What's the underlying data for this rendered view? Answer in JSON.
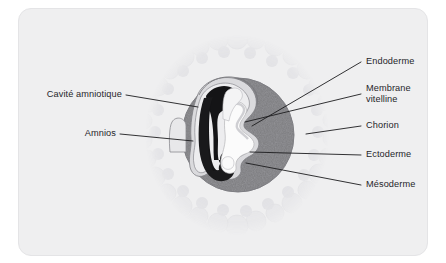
{
  "figure": {
    "width": 446,
    "height": 263,
    "background_color": "#ffffff",
    "panel_color": "#efeff0",
    "panel_border_color": "#e4e4e6"
  },
  "diagram": {
    "type": "labelled anatomical cross-section",
    "structures": [
      {
        "name": "villosites-choriales",
        "description": "halo fuzzy de villosites autour de l'oeuf",
        "color": "#e2e2e4"
      },
      {
        "name": "chorion-disc",
        "description": "disque gris entourant l'embryon",
        "color": "#9e9ea2"
      },
      {
        "name": "cavite-amniotique",
        "description": "zone noire en forme de C a gauche de l'embryon",
        "color": "#141416"
      },
      {
        "name": "amnios",
        "description": "fine membrane claire bordant la cavite amniotique",
        "color": "#d8d8da"
      },
      {
        "name": "vesicule-vitelline",
        "description": "region blanche centrale lobee",
        "color": "#fbfbfb"
      },
      {
        "name": "membrane-vitelline",
        "description": "liseré clair autour de la vesicule vitelline",
        "color": "#e7e7e9"
      },
      {
        "name": "pocket-left",
        "description": "petite poche claire a gauche dans le chorion",
        "color": "#e9e9ea"
      }
    ]
  },
  "labels": {
    "left": [
      {
        "id": "cavite-amniotique",
        "text": "Cavité amniotique",
        "text_x": 118,
        "text_y": 95,
        "anchor_x": 122,
        "anchor_y": 95,
        "tip_x": 196,
        "tip_y": 107
      },
      {
        "id": "amnios",
        "text": "Amnios",
        "text_x": 112,
        "text_y": 134,
        "anchor_x": 116,
        "anchor_y": 134,
        "tip_x": 192,
        "tip_y": 141
      }
    ],
    "right": [
      {
        "id": "endoderme",
        "text": "Endoderme",
        "text_x": 366,
        "text_y": 62,
        "anchor_x": 362,
        "anchor_y": 62,
        "tip_x": 253,
        "tip_y": 125
      },
      {
        "id": "membrane-vitelline",
        "text": "Membrane\nvitelline",
        "line1": "Membrane",
        "line2": "vitelline",
        "text_x": 366,
        "text_y": 89,
        "anchor_x": 362,
        "anchor_y": 94,
        "tip_x": 246,
        "tip_y": 122
      },
      {
        "id": "chorion",
        "text": "Chorion",
        "text_x": 366,
        "text_y": 126,
        "anchor_x": 362,
        "anchor_y": 126,
        "tip_x": 305,
        "tip_y": 135
      },
      {
        "id": "ectoderme",
        "text": "Ectoderme",
        "text_x": 366,
        "text_y": 155,
        "anchor_x": 362,
        "anchor_y": 155,
        "tip_x": 249,
        "tip_y": 152
      },
      {
        "id": "mesoderme",
        "text": "Mésoderme",
        "text_x": 366,
        "text_y": 185,
        "anchor_x": 362,
        "anchor_y": 185,
        "tip_x": 246,
        "tip_y": 163
      }
    ]
  },
  "style": {
    "leader_color": "#1c1c1e",
    "leader_width": 0.9,
    "text_color": "#26262a",
    "font_size_px": 9.2
  }
}
